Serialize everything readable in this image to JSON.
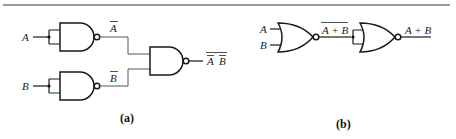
{
  "figure": {
    "top_rule_color": "#777777",
    "panel_a": {
      "caption": "(a)",
      "inputs": {
        "a": "A",
        "b": "B"
      },
      "intermediate": {
        "a_not": "A",
        "b_not": "B"
      },
      "output": {
        "left": "A",
        "right": "B"
      },
      "description": "Two NAND gates with tied inputs act as inverters producing A-bar and B-bar, which feed a NAND gate whose output is the double-overlined product of A-bar and B-bar"
    },
    "panel_b": {
      "caption": "(b)",
      "inputs": {
        "a": "A",
        "b": "B"
      },
      "intermediate": "A + B",
      "output": "A + B",
      "description": "A NOR gate produces overline(A + B), which feeds a NOR gate with tied inputs acting as inverter giving A + B"
    }
  }
}
